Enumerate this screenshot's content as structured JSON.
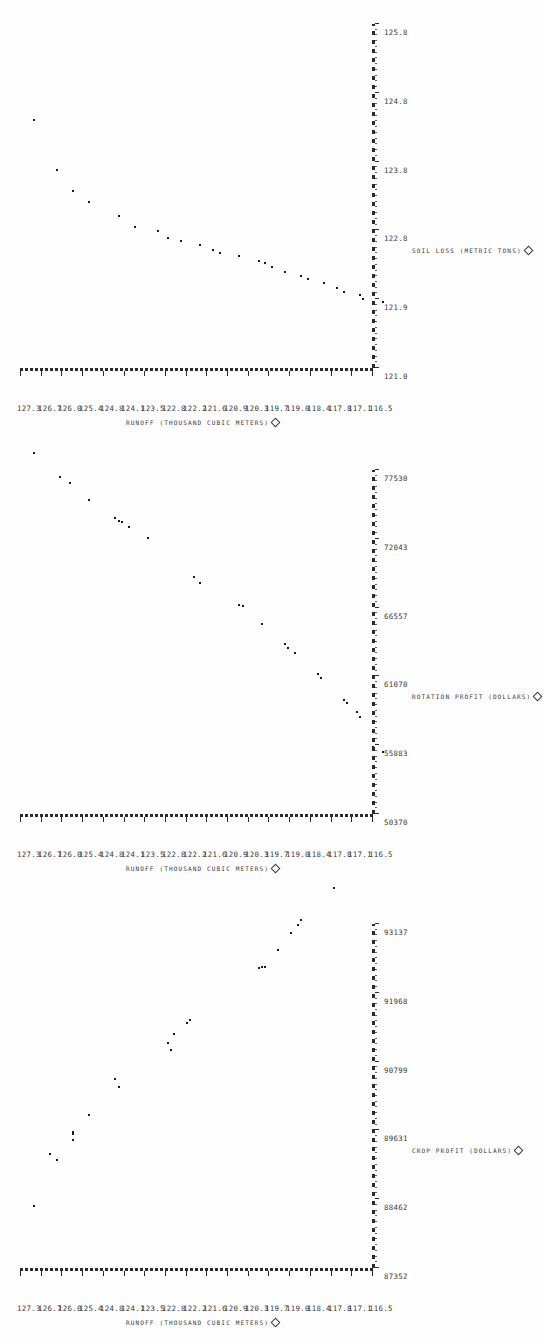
{
  "figure": {
    "style": "line-printer scatter plots, rotated 90 degrees",
    "panel_count": 3,
    "axis_marker_icon": "diamond-icon"
  },
  "shared": {
    "yaxis_title_main": "Runoff",
    "yaxis_title_units": "(Thousand Cubic Meters)",
    "yticks": [
      "127.3",
      "126.7",
      "126.0",
      "125.4",
      "124.8",
      "124.1",
      "123.5",
      "122.8",
      "122.2",
      "121.6",
      "120.9",
      "120.3",
      "119.7",
      "119.0",
      "118.4",
      "117.8",
      "117.1",
      "116.5"
    ],
    "ylim": [
      116.5,
      127.3
    ]
  },
  "chart_data": [
    {
      "type": "scatter",
      "panel": 1,
      "title": "",
      "xlabel": "Crop Profit (Dollars)",
      "ylabel": "Runoff (Thousand Cubic Meters)",
      "xticks": [
        "87352",
        "88462",
        "89631",
        "90799",
        "91968",
        "93137"
      ],
      "xlim": [
        87352,
        93137
      ],
      "ylim": [
        116.5,
        127.3
      ],
      "grid": false,
      "legend": "none",
      "points": [
        {
          "x": 87352,
          "y": 127.3
        },
        {
          "x": 88130,
          "y": 126.6
        },
        {
          "x": 88230,
          "y": 126.8
        },
        {
          "x": 88470,
          "y": 126.1
        },
        {
          "x": 88560,
          "y": 126.1
        },
        {
          "x": 88600,
          "y": 126.1
        },
        {
          "x": 88880,
          "y": 125.6
        },
        {
          "x": 89350,
          "y": 124.7
        },
        {
          "x": 89480,
          "y": 124.8
        },
        {
          "x": 89980,
          "y": 123.1
        },
        {
          "x": 90100,
          "y": 123.2
        },
        {
          "x": 90250,
          "y": 123.0
        },
        {
          "x": 90430,
          "y": 122.6
        },
        {
          "x": 90480,
          "y": 122.5
        },
        {
          "x": 91360,
          "y": 120.4
        },
        {
          "x": 91370,
          "y": 120.3
        },
        {
          "x": 91370,
          "y": 120.2
        },
        {
          "x": 91660,
          "y": 119.8
        },
        {
          "x": 91950,
          "y": 119.4
        },
        {
          "x": 92070,
          "y": 119.2
        },
        {
          "x": 92170,
          "y": 119.1
        },
        {
          "x": 92700,
          "y": 118.1
        }
      ]
    },
    {
      "type": "scatter",
      "panel": 2,
      "title": "",
      "xlabel": "Rotation Profit (Dollars)",
      "ylabel": "Runoff (Thousand Cubic Meters)",
      "xticks": [
        "50370",
        "55883",
        "61070",
        "66557",
        "72043",
        "77530"
      ],
      "xlim": [
        50370,
        77530
      ],
      "ylim": [
        116.5,
        127.3
      ],
      "grid": false,
      "legend": "none",
      "points": [
        {
          "x": 50370,
          "y": 116.6
        },
        {
          "x": 50800,
          "y": 116.9
        },
        {
          "x": 53150,
          "y": 117.3
        },
        {
          "x": 53500,
          "y": 117.4
        },
        {
          "x": 54200,
          "y": 117.7
        },
        {
          "x": 54450,
          "y": 117.8
        },
        {
          "x": 56200,
          "y": 118.5
        },
        {
          "x": 56550,
          "y": 118.6
        },
        {
          "x": 58150,
          "y": 119.3
        },
        {
          "x": 58600,
          "y": 119.5
        },
        {
          "x": 58900,
          "y": 119.6
        },
        {
          "x": 60500,
          "y": 120.3
        },
        {
          "x": 61900,
          "y": 120.9
        },
        {
          "x": 61950,
          "y": 121.0
        },
        {
          "x": 63700,
          "y": 122.2
        },
        {
          "x": 64150,
          "y": 122.4
        },
        {
          "x": 67300,
          "y": 123.8
        },
        {
          "x": 68150,
          "y": 124.4
        },
        {
          "x": 68550,
          "y": 124.6
        },
        {
          "x": 68600,
          "y": 124.7
        },
        {
          "x": 68850,
          "y": 124.8
        },
        {
          "x": 70250,
          "y": 125.6
        },
        {
          "x": 71600,
          "y": 126.2
        },
        {
          "x": 72100,
          "y": 126.5
        },
        {
          "x": 74000,
          "y": 127.3
        }
      ]
    },
    {
      "type": "scatter",
      "panel": 3,
      "title": "",
      "xlabel": "Soil Loss (Metric Tons)",
      "ylabel": "Runoff (Thousand Cubic Meters)",
      "xticks": [
        "121.0",
        "121.9",
        "122.8",
        "123.8",
        "124.8",
        "125.8"
      ],
      "xlim": [
        121.0,
        125.8
      ],
      "ylim": [
        116.5,
        127.3
      ],
      "grid": false,
      "legend": "none",
      "points": [
        {
          "x": 121.05,
          "y": 116.6
        },
        {
          "x": 121.1,
          "y": 117.2
        },
        {
          "x": 121.15,
          "y": 117.3
        },
        {
          "x": 121.2,
          "y": 117.8
        },
        {
          "x": 121.25,
          "y": 118.0
        },
        {
          "x": 121.32,
          "y": 118.4
        },
        {
          "x": 121.38,
          "y": 118.9
        },
        {
          "x": 121.42,
          "y": 119.1
        },
        {
          "x": 121.48,
          "y": 119.6
        },
        {
          "x": 121.55,
          "y": 120.0
        },
        {
          "x": 121.6,
          "y": 120.2
        },
        {
          "x": 121.63,
          "y": 120.4
        },
        {
          "x": 121.7,
          "y": 121.0
        },
        {
          "x": 121.74,
          "y": 121.6
        },
        {
          "x": 121.78,
          "y": 121.8
        },
        {
          "x": 121.85,
          "y": 122.2
        },
        {
          "x": 121.9,
          "y": 122.8
        },
        {
          "x": 121.95,
          "y": 123.2
        },
        {
          "x": 122.05,
          "y": 123.5
        },
        {
          "x": 122.1,
          "y": 124.2
        },
        {
          "x": 122.25,
          "y": 124.7
        },
        {
          "x": 122.45,
          "y": 125.6
        },
        {
          "x": 122.6,
          "y": 126.1
        },
        {
          "x": 122.9,
          "y": 126.6
        },
        {
          "x": 123.6,
          "y": 127.3
        }
      ]
    }
  ]
}
